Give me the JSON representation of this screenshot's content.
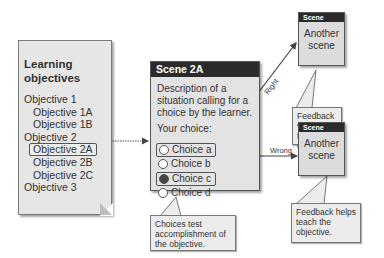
{
  "objectives": {
    "title_line1": "Learning",
    "title_line2": "objectives",
    "items": [
      {
        "label": "Objective 1"
      },
      {
        "label": "Objective 1A"
      },
      {
        "label": "Objective 1B"
      },
      {
        "label": "Objective 2"
      },
      {
        "label": "Objective 2A"
      },
      {
        "label": "Objective 2B"
      },
      {
        "label": "Objective 2C"
      },
      {
        "label": "Objective 3"
      }
    ]
  },
  "scene_main": {
    "title": "Scene 2A",
    "description": "Description of a situation calling for a choice by the learner.",
    "prompt": "Your choice:",
    "choices": [
      {
        "label": "Choice a"
      },
      {
        "label": "Choice b"
      },
      {
        "label": "Choice c"
      },
      {
        "label": "Choice d"
      }
    ],
    "callout": "Choices test accomplishment of the objective."
  },
  "scene_right": {
    "title": "Scene",
    "body": "Another scene",
    "arrow_label": "Right",
    "callout": "Feedback verifies the objective."
  },
  "scene_wrong": {
    "title": "Scene",
    "body": "Another scene",
    "arrow_label": "Wrong",
    "callout": "Feedback helps teach the objective."
  }
}
